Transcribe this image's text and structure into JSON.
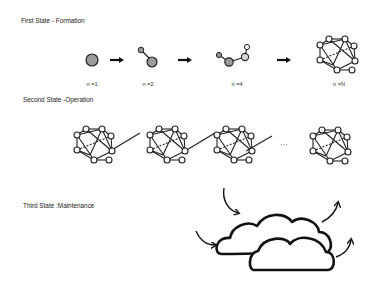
{
  "states": {
    "first": {
      "title": "First State - Formation",
      "steps": [
        {
          "label": "n =1",
          "nodes": 1
        },
        {
          "label": "n =2",
          "nodes": 2
        },
        {
          "label": "n =4",
          "nodes": 4
        },
        {
          "label": "n =N",
          "nodes": "N"
        }
      ],
      "arrow_icon": "right-arrow-icon"
    },
    "second": {
      "title": "Second State  -Operation",
      "network_count_shown": 4,
      "ellipsis": "..."
    },
    "third": {
      "title": "Third State :Maintenance",
      "clouds": 2,
      "incoming_arrows": 2,
      "outgoing_arrows": 2
    }
  },
  "colors": {
    "node_fill_grey": "#9a9a9a",
    "node_fill_light": "#d8d8d8",
    "stroke": "#222222",
    "background": "#ffffff"
  }
}
